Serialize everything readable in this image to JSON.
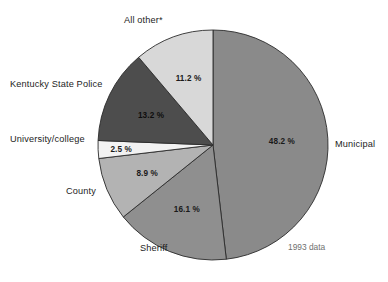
{
  "chart_data": {
    "type": "pie",
    "title": "",
    "subtitle": "",
    "note": "1993 data",
    "footnote_marker": "*",
    "legend_position": "outside-labels",
    "grid": false,
    "units": "percent",
    "start_angle_deg": 0,
    "direction": "clockwise",
    "categories": [
      "Municipal",
      "Sheriff",
      "County",
      "University/college",
      "Kentucky State Police",
      "All other*"
    ],
    "values": [
      48.2,
      16.1,
      8.9,
      2.5,
      13.2,
      11.2
    ],
    "value_labels": [
      "48.2 %",
      "16.1 %",
      "8.9 %",
      "2.5 %",
      "13.2 %",
      "11.2 %"
    ],
    "colors": [
      "#8a8a8a",
      "#8f8f8f",
      "#b3b3b3",
      "#f2f2f2",
      "#4d4d4d",
      "#d8d8d8"
    ],
    "slices": [
      {
        "label": "Municipal",
        "value": 48.2,
        "value_label": "48.2 %",
        "color": "#8a8a8a",
        "label_color": "#1d1d1d",
        "value_color": "#1a1a1a"
      },
      {
        "label": "Sheriff",
        "value": 16.1,
        "value_label": "16.1 %",
        "color": "#8f8f8f",
        "label_color": "#1d1d1d",
        "value_color": "#1a1a1a"
      },
      {
        "label": "County",
        "value": 8.9,
        "value_label": "8.9 %",
        "color": "#b3b3b3",
        "label_color": "#1d1d1d",
        "value_color": "#1a1a1a"
      },
      {
        "label": "University/college",
        "value": 2.5,
        "value_label": "2.5 %",
        "color": "#f2f2f2",
        "label_color": "#1d1d1d",
        "value_color": "#1a1a1a"
      },
      {
        "label": "Kentucky State Police",
        "value": 13.2,
        "value_label": "13.2 %",
        "color": "#4d4d4d",
        "label_color": "#1d1d1d",
        "value_color": "#0d0d0d"
      },
      {
        "label": "All other*",
        "value": 11.2,
        "value_label": "11.2 %",
        "color": "#d8d8d8",
        "label_color": "#1d1d1d",
        "value_color": "#1a1a1a"
      }
    ]
  },
  "labels": {
    "all_other": "All other*",
    "kentucky_state_police": "Kentucky State Police",
    "university_college": "University/college",
    "county": "County",
    "sheriff": "Sheriff",
    "municipal": "Municipal",
    "data_note": "1993 data"
  },
  "values": {
    "all_other": "11.2 %",
    "kentucky_state_police": "13.2 %",
    "university_college": "2.5 %",
    "county": "8.9 %",
    "sheriff": "16.1 %",
    "municipal": "48.2 %"
  },
  "caption": ""
}
